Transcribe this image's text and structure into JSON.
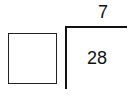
{
  "problem": {
    "type": "long-division",
    "divisor_box": "",
    "quotient": "7",
    "dividend": "28"
  }
}
